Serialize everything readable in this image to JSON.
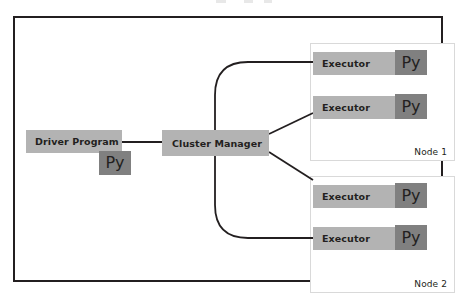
{
  "diagram": {
    "frame": {
      "border_color": "#231f20",
      "background": "#ffffff"
    },
    "palette": {
      "component_fill": "#b3b3b3",
      "py_chip_fill": "#808080",
      "node_border": "#d9d9d9",
      "line_color": "#231f20",
      "text_color": "#231f20"
    },
    "driver": {
      "label": "Driver Program",
      "py_chip": "Py"
    },
    "cluster_manager": {
      "label": "Cluster Manager"
    },
    "nodes": [
      {
        "label": "Node 1",
        "executors": [
          {
            "label": "Executor",
            "py_chip": "Py"
          },
          {
            "label": "Executor",
            "py_chip": "Py"
          }
        ]
      },
      {
        "label": "Node 2",
        "executors": [
          {
            "label": "Executor",
            "py_chip": "Py"
          },
          {
            "label": "Executor",
            "py_chip": "Py"
          }
        ]
      }
    ],
    "connections": [
      {
        "from": "Driver Program",
        "to": "Cluster Manager",
        "style": "straight"
      },
      {
        "from": "Cluster Manager",
        "to": "Node 1 Executor 1",
        "style": "curved"
      },
      {
        "from": "Cluster Manager",
        "to": "Node 1 Executor 2",
        "style": "diagonal"
      },
      {
        "from": "Cluster Manager",
        "to": "Node 2 Executor 1",
        "style": "diagonal"
      },
      {
        "from": "Cluster Manager",
        "to": "Node 2 Executor 2",
        "style": "curved"
      }
    ]
  }
}
